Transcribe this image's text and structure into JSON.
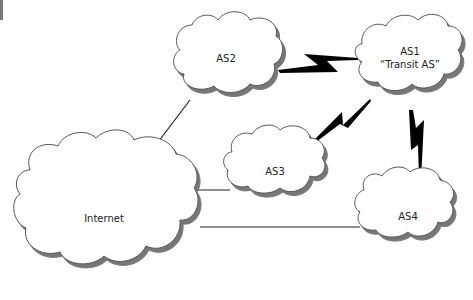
{
  "diagram": {
    "nodes": [
      {
        "id": "as1",
        "label_line1": "AS1",
        "label_line2": "“Transit AS”"
      },
      {
        "id": "as2",
        "label": "AS2"
      },
      {
        "id": "as3",
        "label": "AS3"
      },
      {
        "id": "as4",
        "label": "AS4"
      },
      {
        "id": "internet",
        "label": "Internet"
      }
    ],
    "links": [
      {
        "from": "as2",
        "to": "as1",
        "type": "lightning"
      },
      {
        "from": "as3",
        "to": "as1",
        "type": "lightning"
      },
      {
        "from": "as4",
        "to": "as1",
        "type": "lightning"
      },
      {
        "from": "internet",
        "to": "as2",
        "type": "line"
      },
      {
        "from": "internet",
        "to": "as3",
        "type": "line"
      },
      {
        "from": "internet",
        "to": "as4",
        "type": "line"
      }
    ],
    "colors": {
      "cloud_fill": "#ffffff",
      "cloud_stroke": "#555555",
      "shadow": "#888888",
      "link": "#000000"
    }
  }
}
